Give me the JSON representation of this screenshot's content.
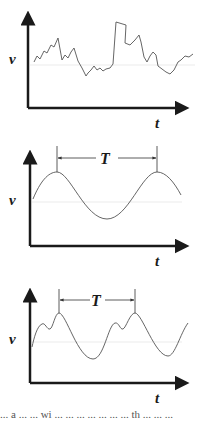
{
  "diagram": {
    "panels": [
      {
        "id": "random",
        "y_label": "v",
        "x_label": "t",
        "period_label": null
      },
      {
        "id": "sinusoid",
        "y_label": "v",
        "x_label": "t",
        "period_label": "T"
      },
      {
        "id": "complex-periodic",
        "y_label": "v",
        "x_label": "t",
        "period_label": "T"
      }
    ],
    "colors": {
      "axis": "#1a1a1a",
      "curve": "#555555",
      "guide": "#dddddd"
    }
  },
  "caption": {
    "text": "... a ... ... wi ... ... ... ... ... ... ... th ... ... ..."
  }
}
